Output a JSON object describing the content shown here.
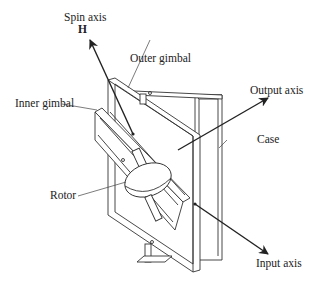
{
  "diagram": {
    "labels": {
      "spin_axis": "Spin axis",
      "spin_symbol": "H",
      "outer_gimbal": "Outer gimbal",
      "inner_gimbal": "Inner gimbal",
      "output_axis": "Output axis",
      "case": "Case",
      "rotor": "Rotor",
      "input_axis": "Input axis"
    },
    "colors": {
      "line": "#333333",
      "background": "#ffffff"
    }
  }
}
